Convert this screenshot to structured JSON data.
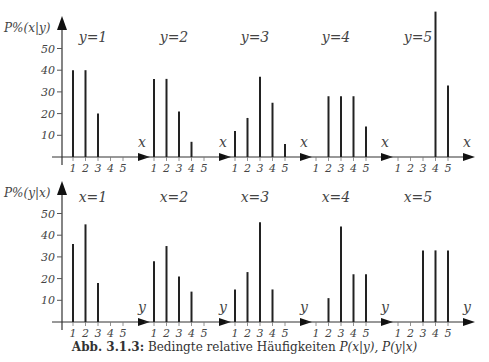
{
  "caption": {
    "label": "Abb. 3.1.3:",
    "text": "Bedingte relative Häufigkeiten",
    "formula": "P(x|y), P(y|x)"
  },
  "chart_data": [
    {
      "type": "bar",
      "row": "top",
      "ylabel": "P%(x|y)",
      "xlabel": "x",
      "yticks": [
        10,
        20,
        30,
        40,
        50
      ],
      "ylim": [
        0,
        60
      ],
      "categories": [
        1,
        2,
        3,
        4,
        5
      ],
      "panels": [
        {
          "title": "y=1",
          "values": [
            40,
            40,
            20,
            0,
            0
          ]
        },
        {
          "title": "y=2",
          "values": [
            36,
            36,
            21,
            7,
            0
          ]
        },
        {
          "title": "y=3",
          "values": [
            12,
            18,
            37,
            25,
            6
          ]
        },
        {
          "title": "y=4",
          "values": [
            0,
            28,
            28,
            28,
            14
          ]
        },
        {
          "title": "y=5",
          "values": [
            0,
            0,
            0,
            67,
            33
          ]
        }
      ]
    },
    {
      "type": "bar",
      "row": "bottom",
      "ylabel": "P%(y|x)",
      "xlabel": "y",
      "yticks": [
        10,
        20,
        30,
        40,
        50
      ],
      "ylim": [
        0,
        60
      ],
      "categories": [
        1,
        2,
        3,
        4,
        5
      ],
      "panels": [
        {
          "title": "x=1",
          "values": [
            36,
            45,
            18,
            0,
            0
          ]
        },
        {
          "title": "x=2",
          "values": [
            28,
            35,
            21,
            14,
            0
          ]
        },
        {
          "title": "x=3",
          "values": [
            15,
            23,
            46,
            15,
            0
          ]
        },
        {
          "title": "x=4",
          "values": [
            0,
            11,
            44,
            22,
            22
          ]
        },
        {
          "title": "x=5",
          "values": [
            0,
            0,
            33,
            33,
            33
          ]
        }
      ]
    }
  ]
}
